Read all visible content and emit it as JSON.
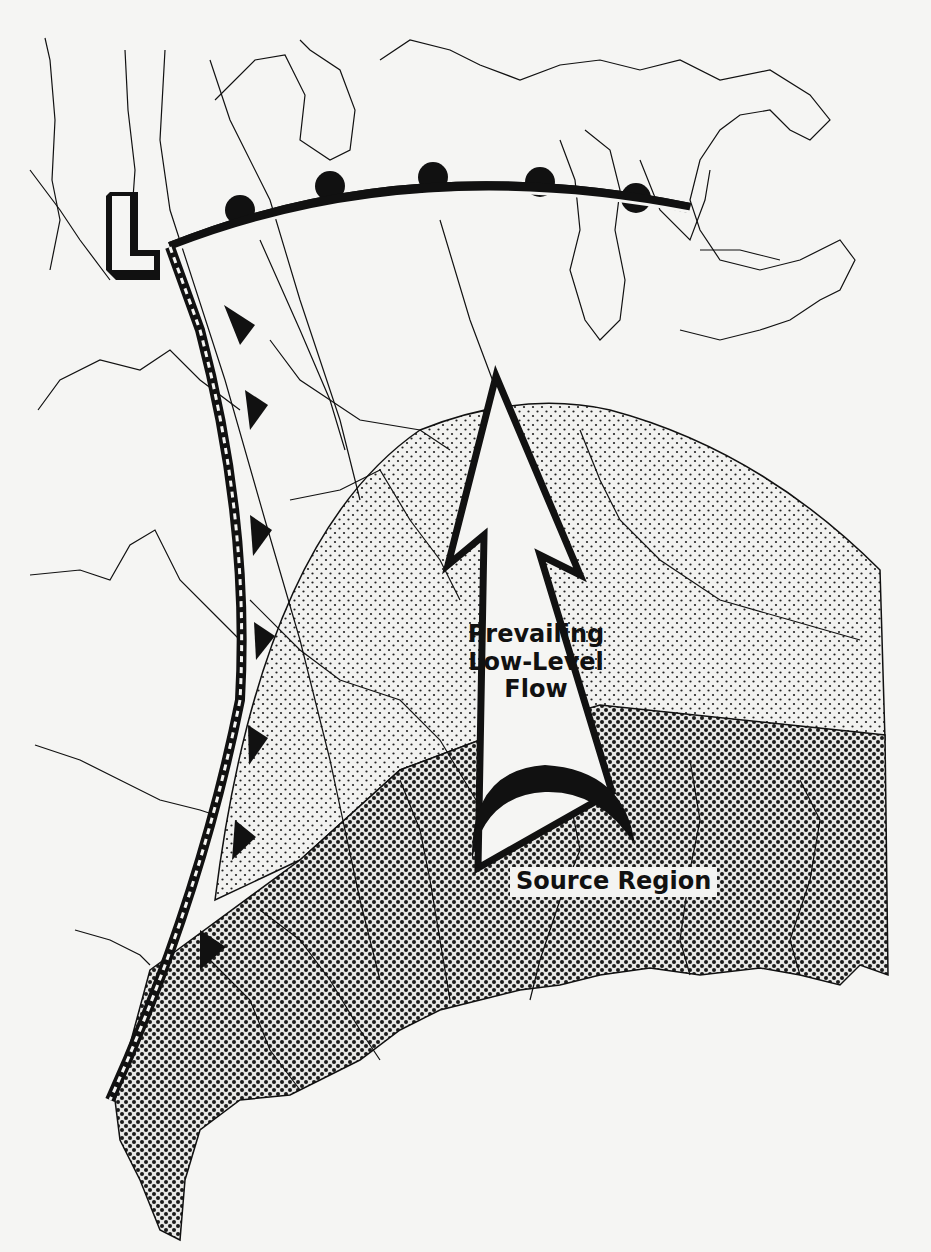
{
  "figure": {
    "type": "weather-map-diagram",
    "labels": {
      "flow_line1": "Prevailing",
      "flow_line2": "Low-Level",
      "flow_line3": "Flow",
      "source": "Source Region",
      "low_pressure_symbol": "L"
    },
    "elements": {
      "warm_front": {
        "symbol": "semicircles",
        "count": 5
      },
      "cold_front": {
        "symbol": "triangles",
        "count": 8
      },
      "light_stipple_region": "dome-shaped area north of source region",
      "dark_stipple_region": "source region (southern/Gulf area)",
      "arrow": "northward flow arrow from source region",
      "source_arc": "black crescent arc at arrow base"
    },
    "colors": {
      "ink": "#111111",
      "paper": "#f5f5f3"
    }
  }
}
